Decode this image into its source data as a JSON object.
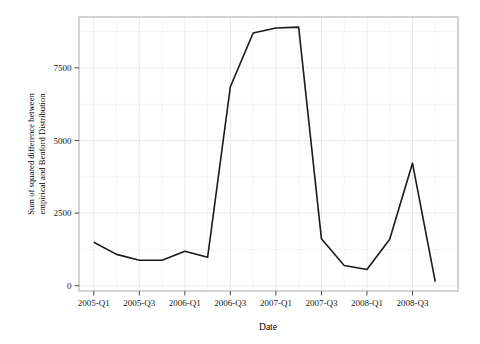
{
  "chart_data": {
    "type": "line",
    "title": "",
    "xlabel": "Date",
    "ylabel": "Sum of squared difference between empirical and Benford Distribution",
    "ylabel_lines": [
      "Sum of squared difference between",
      "empirical and Benford Distribution"
    ],
    "x_tick_labels": [
      "2005-Q1",
      "2005-Q3",
      "2006-Q1",
      "2006-Q3",
      "2007-Q1",
      "2007-Q3",
      "2008-Q1",
      "2008-Q3"
    ],
    "y_tick_labels": [
      "0",
      "2500",
      "5000",
      "7500"
    ],
    "y_tick_values": [
      0,
      2500,
      5000,
      7500
    ],
    "ylim": [
      -180,
      9250
    ],
    "xlim_quarters": [
      -0.65,
      16.0
    ],
    "grid": true,
    "grid_major_color": "#ebebeb",
    "grid_minor_color": "#f5f5f5",
    "legend": "none",
    "line_color": "#1a1a1a",
    "line_width": 1.6,
    "panel_border_color": "#b0b0b0",
    "panel_background": "#ffffff",
    "x": [
      "2005-Q1",
      "2005-Q2",
      "2005-Q3",
      "2005-Q4",
      "2006-Q1",
      "2006-Q2",
      "2006-Q3",
      "2006-Q4",
      "2007-Q1",
      "2007-Q2",
      "2007-Q3",
      "2007-Q4",
      "2008-Q1",
      "2008-Q2",
      "2008-Q3",
      "2008-Q4"
    ],
    "values": [
      1500,
      1080,
      880,
      880,
      1190,
      980,
      6850,
      8700,
      8870,
      8900,
      1620,
      700,
      560,
      1600,
      4220,
      140
    ]
  }
}
